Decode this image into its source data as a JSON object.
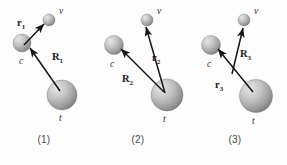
{
  "figure": {
    "type": "three-body-jacobi-coordinates",
    "background_color": "#fdfdfd",
    "width": 287,
    "height": 165,
    "bodies": {
      "c_label": "c",
      "t_label": "t",
      "v_label": "v",
      "sphere_fill_light": "#d8d8d8",
      "sphere_fill_dark": "#8f8f8f",
      "sphere_edge": "#6e6e6e"
    },
    "arrow_color": "#151515",
    "panels": [
      {
        "id": "panel-1",
        "caption": "(1)",
        "caption_x": 44,
        "caption_y": 140,
        "spheres": [
          {
            "name": "v",
            "cx": 49,
            "cy": 20,
            "r": 6.0,
            "label": "v",
            "lx": 59,
            "ly": 14
          },
          {
            "name": "c",
            "cx": 22,
            "cy": 43,
            "r": 9.0,
            "label": "c",
            "lx": 19,
            "ly": 64
          },
          {
            "name": "t",
            "cx": 62,
            "cy": 95,
            "r": 15.0,
            "label": "t",
            "lx": 59,
            "ly": 121
          }
        ],
        "vectors": [
          {
            "name": "r1",
            "from_x": 24,
            "from_y": 45,
            "to_x": 44,
            "to_y": 24,
            "label": "r",
            "sub": "1",
            "lx": 17,
            "ly": 26
          },
          {
            "name": "R1",
            "from_x": 60,
            "from_y": 91,
            "to_x": 30,
            "to_y": 48,
            "label": "R",
            "sub": "1",
            "lx": 52,
            "ly": 60
          }
        ]
      },
      {
        "id": "panel-2",
        "caption": "(2)",
        "caption_x": 138,
        "caption_y": 140,
        "spheres": [
          {
            "name": "v",
            "cx": 147,
            "cy": 20,
            "r": 6.0,
            "label": "v",
            "lx": 157,
            "ly": 14
          },
          {
            "name": "c",
            "cx": 114,
            "cy": 45,
            "r": 9.5,
            "label": "c",
            "lx": 110,
            "ly": 67
          },
          {
            "name": "t",
            "cx": 167,
            "cy": 95,
            "r": 16.0,
            "label": "t",
            "lx": 163,
            "ly": 122
          }
        ],
        "vectors": [
          {
            "name": "r2",
            "from_x": 165,
            "from_y": 93,
            "to_x": 146,
            "to_y": 27,
            "label": "r",
            "sub": "2",
            "lx": 152,
            "ly": 61
          },
          {
            "name": "R2",
            "from_x": 164,
            "from_y": 92,
            "to_x": 121,
            "to_y": 49,
            "label": "R",
            "sub": "2",
            "lx": 122,
            "ly": 82
          }
        ]
      },
      {
        "id": "panel-3",
        "caption": "(3)",
        "caption_x": 235,
        "caption_y": 140,
        "spheres": [
          {
            "name": "v",
            "cx": 244,
            "cy": 20,
            "r": 6.0,
            "label": "v",
            "lx": 254,
            "ly": 14
          },
          {
            "name": "c",
            "cx": 211,
            "cy": 45,
            "r": 9.5,
            "label": "c",
            "lx": 207,
            "ly": 67
          },
          {
            "name": "t",
            "cx": 256,
            "cy": 96,
            "r": 16.5,
            "label": "t",
            "lx": 252,
            "ly": 124
          }
        ],
        "vectors": [
          {
            "name": "R3",
            "from_x": 232,
            "from_y": 74,
            "to_x": 243,
            "to_y": 28,
            "label": "R",
            "sub": "3",
            "lx": 240,
            "ly": 57
          },
          {
            "name": "r3",
            "from_x": 253,
            "from_y": 92,
            "to_x": 218,
            "to_y": 49,
            "label": "r",
            "sub": "3",
            "lx": 215,
            "ly": 88
          }
        ]
      }
    ]
  }
}
